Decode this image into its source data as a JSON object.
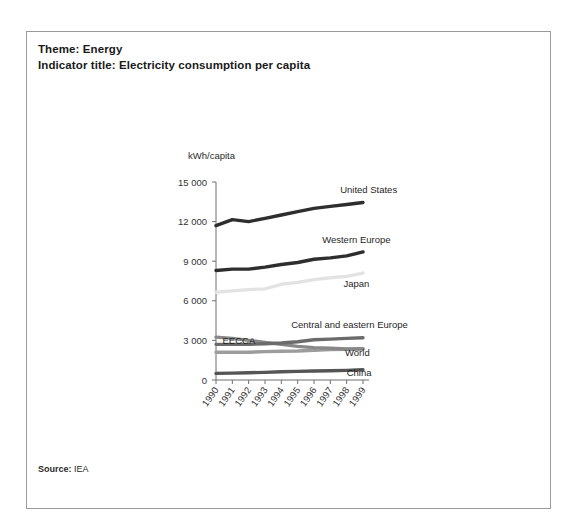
{
  "frame": {
    "theme_line": "Theme: Energy",
    "indicator_line": "Indicator title: Electricity consumption per capita",
    "source_label": "Source:",
    "source_value": "IEA"
  },
  "chart_data": {
    "type": "line",
    "title": "Electricity consumption per capita",
    "xlabel": "",
    "ylabel": "kWh/capita",
    "yunit": "kWh/capita",
    "grid": false,
    "legend_position": "inline-right",
    "x": [
      1990,
      1991,
      1992,
      1993,
      1994,
      1995,
      1996,
      1997,
      1998,
      1999
    ],
    "categories": [
      "1990",
      "1991",
      "1992",
      "1993",
      "1994",
      "1995",
      "1996",
      "1997",
      "1998",
      "1999"
    ],
    "ylim": [
      0,
      15000
    ],
    "yticks": [
      0,
      3000,
      6000,
      9000,
      12000,
      15000
    ],
    "ytick_labels": [
      "0",
      "3 000",
      "6 000",
      "9 000",
      "12 000",
      "15 000"
    ],
    "series": [
      {
        "name": "United States",
        "color": "#2e2e2e",
        "width": 3.4,
        "values": [
          11700,
          12150,
          12000,
          12250,
          12500,
          12750,
          13000,
          13150,
          13300,
          13450
        ],
        "label_x": 1997.6,
        "label_y": 14150
      },
      {
        "name": "Western Europe",
        "color": "#2e2e2e",
        "width": 3.4,
        "values": [
          8300,
          8400,
          8400,
          8550,
          8750,
          8900,
          9150,
          9250,
          9400,
          9700
        ],
        "label_x": 1996.5,
        "label_y": 10350
      },
      {
        "name": "Japan",
        "color": "#e3e3e3",
        "width": 3.4,
        "values": [
          6650,
          6750,
          6850,
          6900,
          7250,
          7400,
          7600,
          7750,
          7850,
          8100
        ],
        "label_x": 1997.8,
        "label_y": 7050
      },
      {
        "name": "Central and eastern Europe",
        "color": "#6b6b6b",
        "width": 3.4,
        "values": [
          2700,
          2700,
          2700,
          2750,
          2800,
          2900,
          3050,
          3100,
          3150,
          3200
        ],
        "label_x": 1994.6,
        "label_y": 3950
      },
      {
        "name": "EECCA",
        "color": "#888888",
        "width": 3.4,
        "values": [
          3250,
          3150,
          3000,
          2850,
          2700,
          2550,
          2450,
          2400,
          2350,
          2350
        ],
        "label_x": 1990.4,
        "label_y": 2750
      },
      {
        "name": "World",
        "color": "#9c9c9c",
        "width": 3.4,
        "values": [
          2100,
          2100,
          2100,
          2150,
          2180,
          2200,
          2250,
          2300,
          2330,
          2380
        ],
        "label_x": 1997.9,
        "label_y": 1850
      },
      {
        "name": "China",
        "color": "#555555",
        "width": 3.4,
        "values": [
          500,
          520,
          550,
          580,
          620,
          650,
          680,
          700,
          730,
          780
        ],
        "label_x": 1998.0,
        "label_y": 330
      }
    ]
  }
}
